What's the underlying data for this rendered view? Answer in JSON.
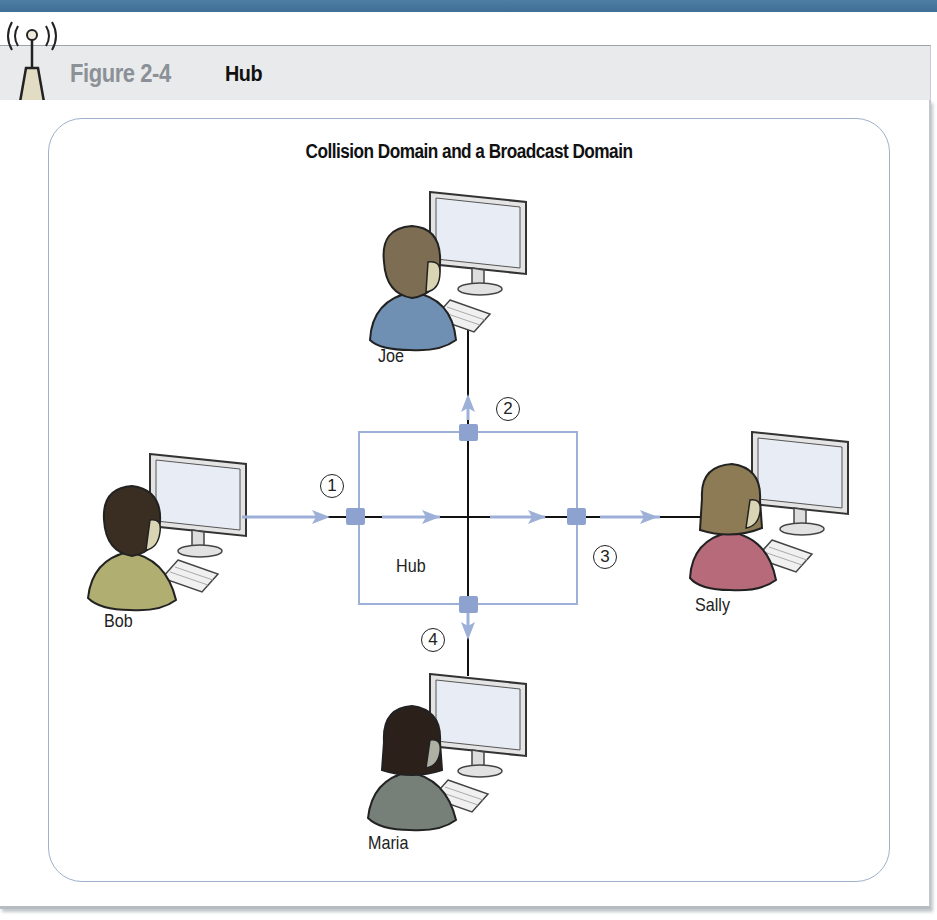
{
  "figure": {
    "number": "Figure 2-4",
    "name": "Hub",
    "icon": "antenna-icon"
  },
  "diagram": {
    "title": "Collision Domain and a Broadcast Domain",
    "hub_label": "Hub",
    "hosts": [
      {
        "name": "Joe",
        "position": "top",
        "hair_color": "#7d6d52",
        "shirt_color": "#6f8fb3"
      },
      {
        "name": "Bob",
        "position": "left",
        "hair_color": "#3a2e22",
        "shirt_color": "#b0ae70"
      },
      {
        "name": "Sally",
        "position": "right",
        "hair_color": "#8c7b54",
        "shirt_color": "#b76a7a"
      },
      {
        "name": "Maria",
        "position": "bottom",
        "hair_color": "#2b201a",
        "shirt_color": "#777f79"
      }
    ],
    "steps": [
      "1",
      "2",
      "3",
      "4"
    ],
    "colors": {
      "accent_blue": "#9db0d8",
      "port_blue": "#8ea2cf",
      "frame_border": "#9fb0cc",
      "header_bar": "#4a7aa0"
    }
  }
}
